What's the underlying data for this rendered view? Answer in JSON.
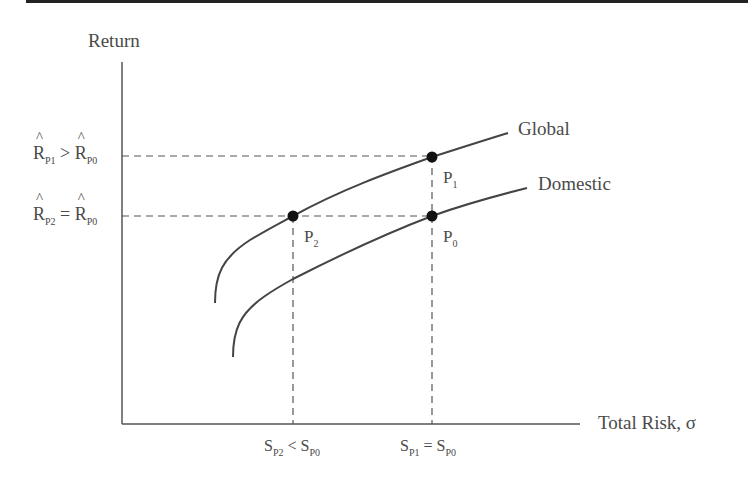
{
  "diagram": {
    "type": "efficient-frontier-comparison",
    "y_axis_label": "Return",
    "x_axis_label": "Total Risk, σ",
    "curves": [
      {
        "name": "Global",
        "label": "Global",
        "color": "#444444"
      },
      {
        "name": "Domestic",
        "label": "Domestic",
        "color": "#444444"
      }
    ],
    "points": [
      {
        "id": "P1",
        "base": "P",
        "sub": "1",
        "curve": "Global"
      },
      {
        "id": "P0",
        "base": "P",
        "sub": "0",
        "curve": "Domestic"
      },
      {
        "id": "P2",
        "base": "P",
        "sub": "2",
        "curve": "Global"
      }
    ],
    "y_tick_labels": [
      {
        "left": "R",
        "left_sub": "P1",
        "relation": ">",
        "right": "R",
        "right_sub": "P0",
        "text": "R̂P1 > R̂P0"
      },
      {
        "left": "R",
        "left_sub": "P2",
        "relation": "=",
        "right": "R",
        "right_sub": "P0",
        "text": "R̂P2 = R̂P0"
      }
    ],
    "x_tick_labels": [
      {
        "left": "S",
        "left_sub": "P2",
        "relation": "<",
        "right": "S",
        "right_sub": "P0",
        "text": "SP2 < SP0"
      },
      {
        "left": "S",
        "left_sub": "P1",
        "relation": "=",
        "right": "S",
        "right_sub": "P0",
        "text": "SP1 = SP0"
      }
    ]
  }
}
